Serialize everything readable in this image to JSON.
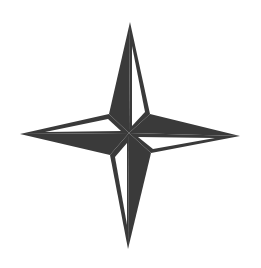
{
  "image": {
    "title": "Four-pointed compass star",
    "background_color": "#ffffff",
    "fill_color": "#3a3a3a",
    "highlight_color": "#ffffff"
  },
  "star": {
    "icon": "compass-star-icon",
    "center": [
      129,
      133
    ],
    "tips": {
      "north": [
        130,
        22
      ],
      "east": [
        240,
        136
      ],
      "south": [
        128,
        249
      ],
      "west": [
        20,
        134
      ]
    },
    "shoulders": {
      "north_east": [
        150,
        114
      ],
      "south_east": [
        151,
        153
      ],
      "south_west": [
        110,
        155
      ],
      "north_west": [
        109,
        114
      ]
    }
  }
}
